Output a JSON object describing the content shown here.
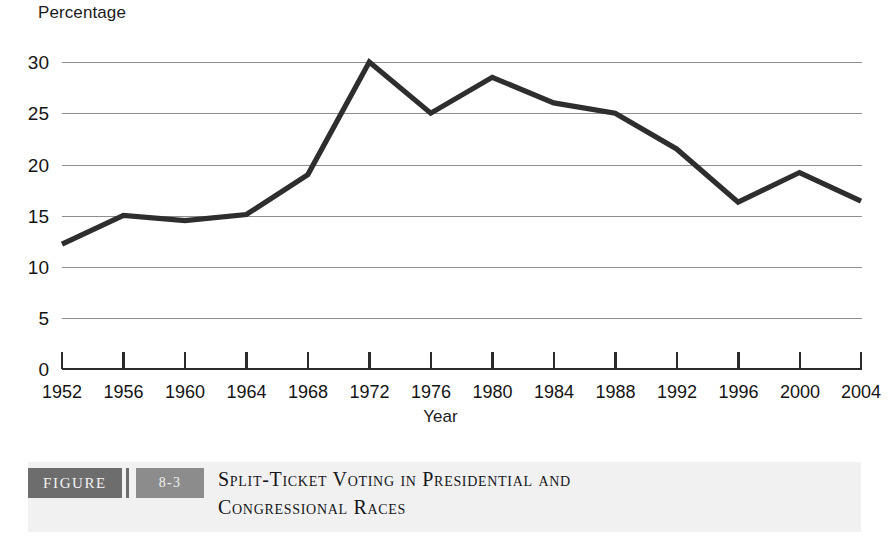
{
  "chart_data": {
    "type": "line",
    "title": "Split-Ticket Voting in Presidential and Congressional Races",
    "xlabel": "Year",
    "ylabel": "Percentage",
    "categories": [
      1952,
      1956,
      1960,
      1964,
      1968,
      1972,
      1976,
      1980,
      1984,
      1988,
      1992,
      1996,
      2000,
      2004
    ],
    "x_tick_labels": [
      "1952",
      "1956",
      "1960",
      "1964",
      "1968",
      "1972",
      "1976",
      "1980",
      "1984",
      "1988",
      "1992",
      "1996",
      "2000",
      "2004"
    ],
    "values": [
      12.2,
      15.0,
      14.5,
      15.1,
      19.0,
      30.0,
      25.0,
      28.5,
      26.0,
      25.0,
      21.5,
      16.3,
      19.2,
      16.4
    ],
    "series": [
      {
        "name": "Split-ticket voting",
        "values": [
          12.2,
          15.0,
          14.5,
          15.1,
          19.0,
          30.0,
          25.0,
          28.5,
          26.0,
          25.0,
          21.5,
          16.3,
          19.2,
          16.4
        ]
      }
    ],
    "y_tick_labels": [
      "30",
      "25",
      "20",
      "15",
      "10",
      "5",
      "0"
    ],
    "y_ticks": [
      30,
      25,
      20,
      15,
      10,
      5,
      0
    ],
    "ylim": [
      0,
      32
    ],
    "xlim": [
      1952,
      2004
    ],
    "grid": "horizontal",
    "legend": "none",
    "line_color": "#2e2e2e",
    "grid_color": "#8e8e8e",
    "axis_color": "#2b2b2b"
  },
  "caption": {
    "figure_word": "FIGURE",
    "figure_number": "8-3",
    "title_line_1": "Split-Ticket Voting in Presidential and",
    "title_line_2": "Congressional Races",
    "band_color": "#f1f1f1",
    "figure_box_color": "#6d6d6d",
    "number_box_color": "#8c8c8c"
  }
}
